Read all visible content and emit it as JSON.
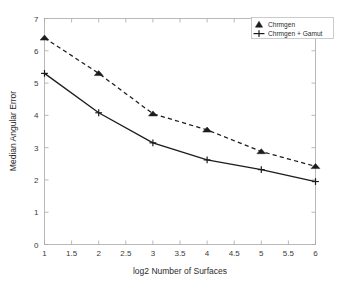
{
  "chart_data": {
    "type": "line",
    "title": "",
    "xlabel": "log2 Number of Surfaces",
    "ylabel": "Median Angular Error",
    "x": [
      1,
      2,
      3,
      4,
      5,
      6
    ],
    "xlim": [
      1,
      6
    ],
    "ylim": [
      0,
      7
    ],
    "xticks": [
      1,
      1.5,
      2,
      2.5,
      3,
      3.5,
      4,
      4.5,
      5,
      5.5,
      6
    ],
    "xticklabels": [
      "1",
      "1.5",
      "2",
      "2.5",
      "3",
      "3.5",
      "4",
      "4.5",
      "5",
      "5.5",
      "6"
    ],
    "yticks": [
      0,
      1,
      2,
      3,
      4,
      5,
      6,
      7
    ],
    "yticklabels": [
      "0",
      "1",
      "2",
      "3",
      "4",
      "5",
      "6",
      "7"
    ],
    "grid": false,
    "legend_position": "top-right",
    "series": [
      {
        "name": "Chrmgen",
        "values": [
          6.4,
          5.3,
          4.05,
          3.55,
          2.88,
          2.42
        ],
        "linestyle": "dashed",
        "marker": "triangle",
        "color": "#1c1c1c"
      },
      {
        "name": "Chrmgen + Gamut",
        "values": [
          5.3,
          4.08,
          3.15,
          2.62,
          2.32,
          1.95
        ],
        "linestyle": "solid",
        "marker": "plus",
        "color": "#1c1c1c"
      }
    ]
  },
  "legend": {
    "entries": [
      {
        "label": "Chrmgen",
        "marker": "triangle-marker-icon"
      },
      {
        "label": "Chrmgen + Gamut",
        "marker": "plus-marker-icon"
      }
    ]
  },
  "axes": {
    "x_title": "log2 Number of Surfaces",
    "y_title": "Median Angular Error"
  }
}
